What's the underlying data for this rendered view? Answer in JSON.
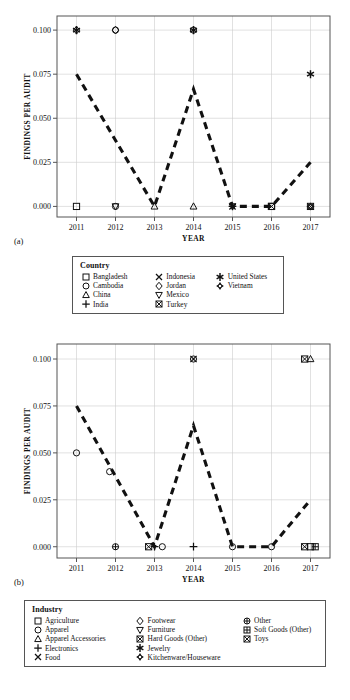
{
  "figure_a": {
    "panel_label": "(a)",
    "chart_data": {
      "type": "scatter",
      "title": "",
      "xlabel": "YEAR",
      "ylabel": "FINDINGS PER AUDIT",
      "xticks": [
        "2011",
        "2012",
        "2013",
        "2014",
        "2015",
        "2016",
        "2017"
      ],
      "yticks": [
        "0.000",
        "0.025",
        "0.050",
        "0.075",
        "0.100"
      ],
      "xlim": [
        2010.5,
        2017.5
      ],
      "ylim": [
        -0.006,
        0.108
      ],
      "grid": true,
      "legend_position": "below",
      "line_series": {
        "name": "trend",
        "style": "dashed",
        "x": [
          2011,
          2013,
          2014,
          2015,
          2016,
          2017
        ],
        "y": [
          0.075,
          0.0,
          0.0665,
          0.0,
          0.0,
          0.025
        ]
      },
      "points": [
        {
          "x": 2011,
          "y": 0.1,
          "marker": "diamond",
          "label": "Jordan"
        },
        {
          "x": 2011,
          "y": 0.1,
          "marker": "asterisk",
          "label": "United States"
        },
        {
          "x": 2011,
          "y": 0.0,
          "marker": "square",
          "label": "Bangladesh"
        },
        {
          "x": 2012,
          "y": 0.1,
          "marker": "diamond",
          "label": "Jordan"
        },
        {
          "x": 2012,
          "y": 0.1,
          "marker": "circle",
          "label": "Cambodia"
        },
        {
          "x": 2012,
          "y": 0.0,
          "marker": "triangle-down",
          "label": "Mexico"
        },
        {
          "x": 2012,
          "y": 0.0,
          "marker": "circle",
          "label": "Cambodia"
        },
        {
          "x": 2013,
          "y": 0.0,
          "marker": "triangle-up",
          "label": "China"
        },
        {
          "x": 2014,
          "y": 0.1,
          "marker": "circle",
          "label": "Cambodia"
        },
        {
          "x": 2014,
          "y": 0.1,
          "marker": "asterisk",
          "label": "United States"
        },
        {
          "x": 2014,
          "y": 0.0,
          "marker": "triangle-up",
          "label": "China"
        },
        {
          "x": 2015,
          "y": 0.0,
          "marker": "triangle-down",
          "label": "Mexico"
        },
        {
          "x": 2015,
          "y": 0.0,
          "marker": "cross",
          "label": "Indonesia"
        },
        {
          "x": 2015,
          "y": 0.0,
          "marker": "plus",
          "label": "India"
        },
        {
          "x": 2016,
          "y": 0.0,
          "marker": "square-cross",
          "label": "Turkey"
        },
        {
          "x": 2016,
          "y": 0.0,
          "marker": "square",
          "label": "Bangladesh"
        },
        {
          "x": 2017,
          "y": 0.075,
          "marker": "asterisk",
          "label": "United States"
        },
        {
          "x": 2017,
          "y": 0.0,
          "marker": "square-cross",
          "label": "Turkey"
        },
        {
          "x": 2017,
          "y": 0.0,
          "marker": "vietnam",
          "label": "Vietnam"
        }
      ]
    }
  },
  "legend_country": {
    "title": "Country",
    "columns": [
      [
        {
          "marker": "square",
          "label": "Bangladesh"
        },
        {
          "marker": "circle",
          "label": "Cambodia"
        },
        {
          "marker": "triangle-up",
          "label": "China"
        },
        {
          "marker": "plus",
          "label": "India"
        }
      ],
      [
        {
          "marker": "cross",
          "label": "Indonesia"
        },
        {
          "marker": "diamond",
          "label": "Jordan"
        },
        {
          "marker": "triangle-down",
          "label": "Mexico"
        },
        {
          "marker": "square-cross",
          "label": "Turkey"
        }
      ],
      [
        {
          "marker": "asterisk",
          "label": "United States"
        },
        {
          "marker": "vietnam",
          "label": "Vietnam"
        }
      ]
    ]
  },
  "figure_b": {
    "panel_label": "(b)",
    "chart_data": {
      "type": "scatter",
      "title": "",
      "xlabel": "YEAR",
      "ylabel": "FINDINGS PER AUDIT",
      "xticks": [
        "2011",
        "2012",
        "2013",
        "2014",
        "2015",
        "2016",
        "2017"
      ],
      "yticks": [
        "0.000",
        "0.025",
        "0.050",
        "0.075",
        "0.100"
      ],
      "xlim": [
        2010.5,
        2017.5
      ],
      "ylim": [
        -0.006,
        0.108
      ],
      "grid": true,
      "legend_position": "below",
      "line_series": {
        "name": "trend",
        "style": "dashed",
        "x": [
          2011,
          2013,
          2014,
          2015,
          2016,
          2017
        ],
        "y": [
          0.075,
          0.0,
          0.0645,
          0.0,
          0.0,
          0.025
        ]
      },
      "points": [
        {
          "x": 2011,
          "y": 0.05,
          "marker": "circle",
          "label": "Apparel"
        },
        {
          "x": 2011.85,
          "y": 0.04,
          "marker": "circle",
          "label": "Apparel"
        },
        {
          "x": 2012,
          "y": 0.0,
          "marker": "other",
          "label": "Other"
        },
        {
          "x": 2012.85,
          "y": 0.0,
          "marker": "square-cross",
          "label": "Hard Goods (Other)"
        },
        {
          "x": 2013.0,
          "y": 0.0,
          "marker": "plus",
          "label": "Electronics"
        },
        {
          "x": 2013.2,
          "y": 0.0,
          "marker": "circle",
          "label": "Apparel"
        },
        {
          "x": 2014,
          "y": 0.1,
          "marker": "cross",
          "label": "Food"
        },
        {
          "x": 2014,
          "y": 0.1,
          "marker": "circle",
          "label": "Apparel"
        },
        {
          "x": 2014,
          "y": 0.0,
          "marker": "plus",
          "label": "Electronics"
        },
        {
          "x": 2015,
          "y": 0.0,
          "marker": "circle",
          "label": "Apparel"
        },
        {
          "x": 2016,
          "y": 0.0,
          "marker": "circle",
          "label": "Apparel"
        },
        {
          "x": 2016.85,
          "y": 0.1,
          "marker": "square-cross",
          "label": "Toys"
        },
        {
          "x": 2017,
          "y": 0.1,
          "marker": "triangle-up",
          "label": "Apparel Accessories"
        },
        {
          "x": 2016.85,
          "y": 0.0,
          "marker": "square-cross",
          "label": "Hard Goods (Other)"
        },
        {
          "x": 2017.0,
          "y": 0.0,
          "marker": "square",
          "label": "Agriculture"
        },
        {
          "x": 2017.12,
          "y": 0.0,
          "marker": "soft-goods",
          "label": "Soft Goods (Other)"
        }
      ]
    }
  },
  "legend_industry": {
    "title": "Industry",
    "columns": [
      [
        {
          "marker": "square",
          "label": "Agriculture"
        },
        {
          "marker": "circle",
          "label": "Apparel"
        },
        {
          "marker": "triangle-up",
          "label": "Apparel Accessories"
        },
        {
          "marker": "plus",
          "label": "Electronics"
        },
        {
          "marker": "cross",
          "label": "Food"
        }
      ],
      [
        {
          "marker": "diamond",
          "label": "Footwear"
        },
        {
          "marker": "triangle-down",
          "label": "Furniture"
        },
        {
          "marker": "square-cross",
          "label": "Hard Goods (Other)"
        },
        {
          "marker": "asterisk",
          "label": "Jewelry"
        },
        {
          "marker": "vietnam",
          "label": "Kitchenware/Houseware"
        }
      ],
      [
        {
          "marker": "other",
          "label": "Other"
        },
        {
          "marker": "soft-goods",
          "label": "Soft Goods (Other)"
        },
        {
          "marker": "square-cross",
          "label": "Toys"
        }
      ]
    ]
  },
  "style": {
    "line_color": "#111111",
    "marker_color": "#111111",
    "grid_color": "#cccccc",
    "frame_color": "#555555",
    "background": "#ffffff"
  }
}
